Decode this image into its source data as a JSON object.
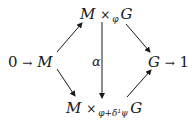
{
  "diagram": {
    "type": "commutative-diagram",
    "nodes": {
      "left": {
        "prefix": "0",
        "arrow": "→",
        "var": "M"
      },
      "top": {
        "left": "M",
        "op": "×",
        "sub": "φ",
        "right": "G"
      },
      "bottom": {
        "left": "M",
        "op": "×",
        "sub": "φ+δ¹ψ",
        "right": "G"
      },
      "right": {
        "var": "G",
        "arrow": "→",
        "suffix": "1"
      }
    },
    "vertical_label": "α",
    "edges": [
      {
        "from": "M",
        "to": "M ×_φ G"
      },
      {
        "from": "M",
        "to": "M ×_{φ+δ¹ψ} G"
      },
      {
        "from": "M ×_φ G",
        "to": "G"
      },
      {
        "from": "M ×_{φ+δ¹ψ} G",
        "to": "G"
      },
      {
        "from": "M ×_φ G",
        "to": "M ×_{φ+δ¹ψ} G",
        "label": "α"
      }
    ]
  }
}
